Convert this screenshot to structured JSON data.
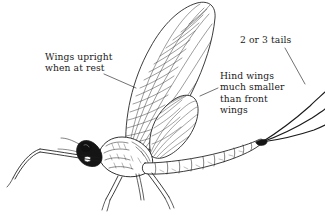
{
  "figure": {
    "name": "mayfly-identification-diagram",
    "background_color": "#ffffff",
    "ink_color": "#1a1a1a",
    "width": 325,
    "height": 216
  },
  "callouts": {
    "wings_upright": {
      "text": "Wings upright\nwhen at rest",
      "line1": "Wings upright",
      "line2": "when at rest"
    },
    "tails": {
      "text": "2 or 3 tails"
    },
    "hind_wings": {
      "text": "Hind wings\nmuch smaller\nthan front\nwings",
      "line1": "Hind wings",
      "line2": "much smaller",
      "line3": "than front",
      "line4": "wings"
    }
  },
  "anatomy": {
    "forewing": "forewing",
    "hindwing": "hindwing",
    "head": "head",
    "eye": "compound-eye",
    "thorax": "thorax",
    "abdomen": "segmented-abdomen",
    "foreleg": "foreleg",
    "midleg": "midleg",
    "hindleg": "hindleg",
    "tails": "cerci-tails",
    "tail_count": 3
  }
}
